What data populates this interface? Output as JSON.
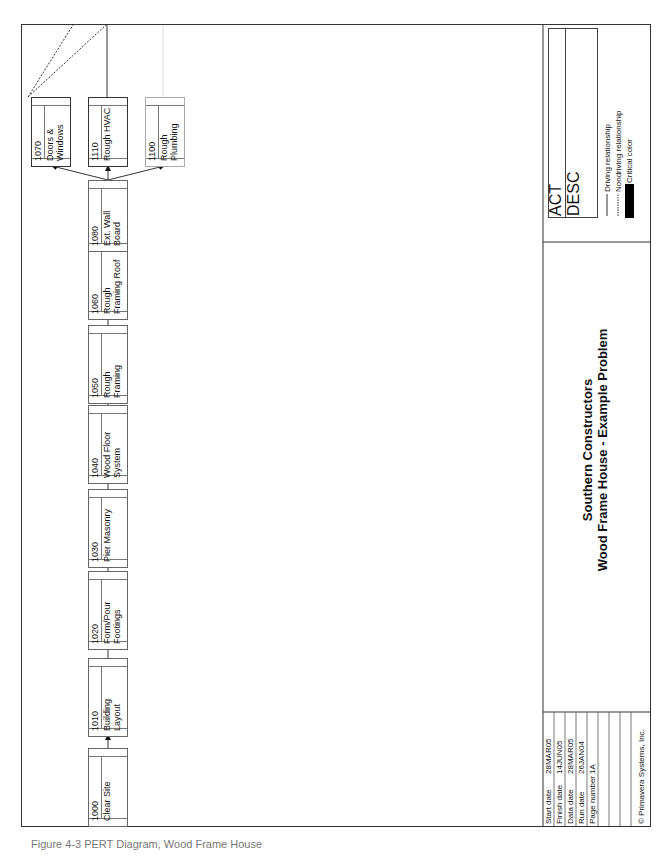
{
  "diagram": {
    "type": "precedence-network",
    "orientation": "rotated-landscape",
    "nodes": [
      {
        "id": "1000",
        "desc": "Clear Site"
      },
      {
        "id": "1010",
        "desc": "Building Layout"
      },
      {
        "id": "1020",
        "desc": "Form/Pour Footings"
      },
      {
        "id": "1030",
        "desc": "Pier Masonry"
      },
      {
        "id": "1040",
        "desc": "Wood Floor System"
      },
      {
        "id": "1050",
        "desc": "Rough Framing"
      },
      {
        "id": "1060",
        "desc": "Rough Framing Roof"
      },
      {
        "id": "1080",
        "desc": "Ext. Wall Board"
      },
      {
        "id": "1070",
        "desc": "Doors & Windows"
      },
      {
        "id": "1110",
        "desc": "Rough HVAC"
      },
      {
        "id": "1100",
        "desc": "Rough Plumbing"
      }
    ],
    "edges": [
      {
        "from": "1000",
        "to": "1010",
        "type": "driving"
      },
      {
        "from": "1010",
        "to": "1020",
        "type": "driving"
      },
      {
        "from": "1020",
        "to": "1030",
        "type": "driving"
      },
      {
        "from": "1030",
        "to": "1040",
        "type": "driving"
      },
      {
        "from": "1040",
        "to": "1050",
        "type": "driving"
      },
      {
        "from": "1050",
        "to": "1060",
        "type": "driving"
      },
      {
        "from": "1060",
        "to": "1080",
        "type": "driving"
      },
      {
        "from": "1080",
        "to": "1070",
        "type": "driving"
      },
      {
        "from": "1080",
        "to": "1110",
        "type": "driving"
      },
      {
        "from": "1080",
        "to": "1100",
        "type": "driving"
      }
    ]
  },
  "nodes_display": {
    "n1000": {
      "id": "1000",
      "line1": "Clear Site",
      "line2": ""
    },
    "n1010": {
      "id": "1010",
      "line1": "Building",
      "line2": "Layout"
    },
    "n1020": {
      "id": "1020",
      "line1": "Form/Pour",
      "line2": "Footings"
    },
    "n1030": {
      "id": "1030",
      "line1": "Pier Masonry",
      "line2": ""
    },
    "n1040": {
      "id": "1040",
      "line1": "Wood Floor",
      "line2": "System"
    },
    "n1050": {
      "id": "1050",
      "line1": "Rough",
      "line2": "Framing"
    },
    "n1060": {
      "id": "1060",
      "line1": "Rough",
      "line2": "Framing Roof"
    },
    "n1080": {
      "id": "1080",
      "line1": "Ext. Wall",
      "line2": "Board"
    },
    "n1070": {
      "id": "1070",
      "line1": "Doors &",
      "line2": "Windows"
    },
    "n1110": {
      "id": "1110",
      "line1": "Rough HVAC",
      "line2": ""
    },
    "n1100": {
      "id": "1100",
      "line1": "Rough",
      "line2": "Plumbing"
    }
  },
  "title_block": {
    "company": "Southern Constructors",
    "project": "Wood Frame House - Example Problem"
  },
  "legend": {
    "box_line1": "ACT",
    "box_line2": "DESC",
    "driving": "Driving relationship",
    "nondriving": "Nondriving relationship",
    "critical": "Critical color",
    "critical_color": "#000000"
  },
  "info": {
    "rows": [
      {
        "label": "Start date",
        "value": "28MAR05"
      },
      {
        "label": "Finish date",
        "value": "14JUN05"
      },
      {
        "label": "Data date",
        "value": "28MAR05"
      },
      {
        "label": "Run date",
        "value": "26JAN04"
      },
      {
        "label": "Page number",
        "value": "1A"
      }
    ],
    "copyright": "© Primavera Systems, Inc."
  },
  "caption": "Figure 4-3  PERT Diagram, Wood Frame House"
}
